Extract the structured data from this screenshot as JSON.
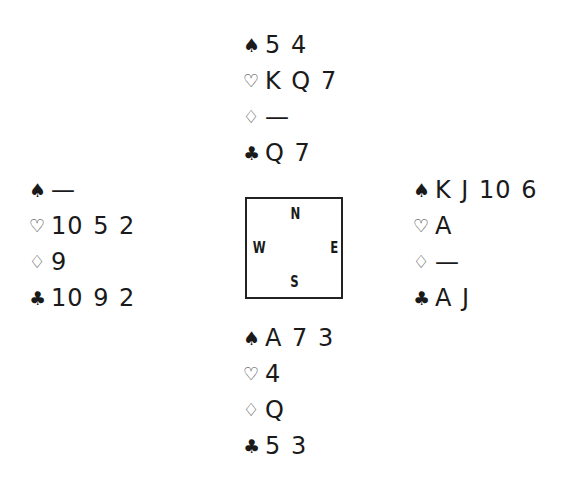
{
  "diagram": {
    "type": "bridge-deal",
    "suit_order": [
      "spades",
      "hearts",
      "diamonds",
      "clubs"
    ],
    "suit_symbols": {
      "spades": "♠",
      "hearts": "♡",
      "diamonds": "♢",
      "clubs": "♣"
    },
    "compass": {
      "north": "N",
      "west": "W",
      "east": "E",
      "south": "S"
    },
    "hands": {
      "north": {
        "spades": "5 4",
        "hearts": "K Q 7",
        "diamonds": "—",
        "clubs": "Q 7"
      },
      "west": {
        "spades": "—",
        "hearts": "10 5 2",
        "diamonds": "9",
        "clubs": "10 9 2"
      },
      "east": {
        "spades": "K J 10 6",
        "hearts": "A",
        "diamonds": "—",
        "clubs": "A J"
      },
      "south": {
        "spades": "A 7 3",
        "hearts": "4",
        "diamonds": "Q",
        "clubs": "5 3"
      }
    }
  }
}
